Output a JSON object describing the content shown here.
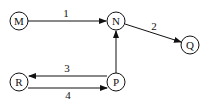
{
  "diagram": {
    "type": "directed-graph",
    "nodes": [
      {
        "id": "M",
        "label": "M",
        "x": 19,
        "y": 21
      },
      {
        "id": "N",
        "label": "N",
        "x": 116,
        "y": 21
      },
      {
        "id": "Q",
        "label": "Q",
        "x": 190,
        "y": 45
      },
      {
        "id": "R",
        "label": "R",
        "x": 19,
        "y": 82
      },
      {
        "id": "P",
        "label": "P",
        "x": 116,
        "y": 82
      }
    ],
    "edges": [
      {
        "from": "M",
        "to": "N",
        "label": "1"
      },
      {
        "from": "N",
        "to": "Q",
        "label": "2"
      },
      {
        "from": "P",
        "to": "R",
        "label": "3"
      },
      {
        "from": "R",
        "to": "P",
        "label": "4"
      },
      {
        "from": "P",
        "to": "N",
        "label": ""
      }
    ],
    "colors": {
      "stroke": "#111111",
      "background": "#ffffff"
    }
  }
}
